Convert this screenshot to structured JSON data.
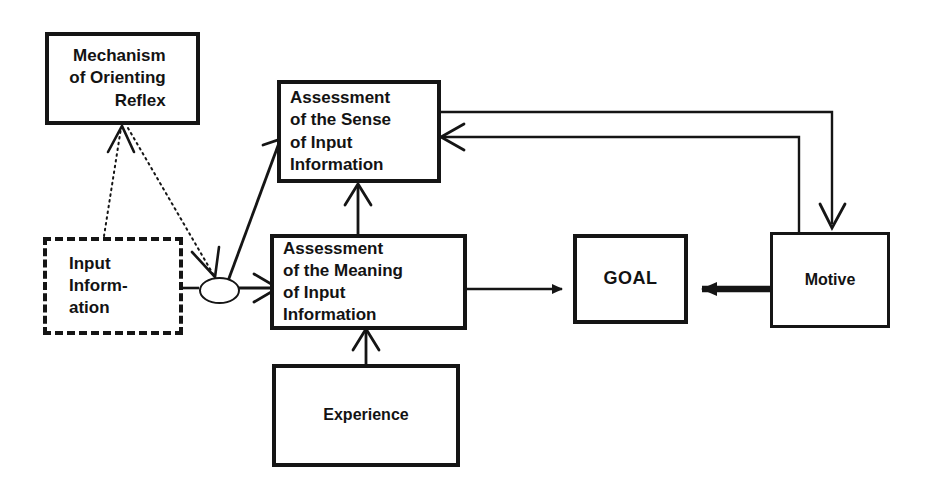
{
  "diagram": {
    "background": "#ffffff",
    "ink": "#151515",
    "nodes": [
      {
        "id": "mechanism",
        "label": "Mechanism\nof Orienting\nReflex",
        "style": "solid-thick"
      },
      {
        "id": "assessment-sense",
        "label": "Assessment\nof the Sense\n of Input\nInformation",
        "style": "solid-thick"
      },
      {
        "id": "assessment-meaning",
        "label": "Assessment\nof the Meaning\nof  Input\nInformation",
        "style": "solid-thick"
      },
      {
        "id": "input-information",
        "label": "Input\nInform-\nation",
        "style": "dashed"
      },
      {
        "id": "experience",
        "label": "Experience",
        "style": "solid-thick"
      },
      {
        "id": "goal",
        "label": "GOAL",
        "style": "solid-thick"
      },
      {
        "id": "motive",
        "label": "Motive",
        "style": "solid-med"
      },
      {
        "id": "junction",
        "label": "",
        "style": "ellipse"
      }
    ],
    "edges": [
      {
        "id": "input-to-junction",
        "from": "input-information",
        "to": "junction",
        "line": "solid",
        "arrow": "none"
      },
      {
        "id": "input-to-mechanism",
        "from": "input-information",
        "to": "mechanism",
        "line": "dotted",
        "arrow": "open-v"
      },
      {
        "id": "mechanism-to-junction",
        "from": "mechanism",
        "to": "junction",
        "line": "dotted",
        "arrow": "open-v"
      },
      {
        "id": "junction-to-assessment-sense",
        "from": "junction",
        "to": "assessment-sense",
        "line": "solid",
        "arrow": "open-v"
      },
      {
        "id": "junction-to-assessment-meaning",
        "from": "junction",
        "to": "assessment-meaning",
        "line": "solid",
        "arrow": "open-v"
      },
      {
        "id": "meaning-to-sense",
        "from": "assessment-meaning",
        "to": "assessment-sense",
        "line": "solid",
        "arrow": "open-v"
      },
      {
        "id": "experience-to-meaning",
        "from": "experience",
        "to": "assessment-meaning",
        "line": "solid",
        "arrow": "open-v"
      },
      {
        "id": "meaning-to-goal",
        "from": "assessment-meaning",
        "to": "goal",
        "line": "solid",
        "arrow": "filled-triangle"
      },
      {
        "id": "motive-to-goal",
        "from": "motive",
        "to": "goal",
        "line": "thick",
        "arrow": "filled-triangle"
      },
      {
        "id": "sense-to-motive",
        "from": "assessment-sense",
        "to": "motive",
        "line": "solid",
        "arrow": "filled-v-down"
      },
      {
        "id": "motive-to-sense",
        "from": "motive",
        "to": "assessment-sense",
        "line": "solid",
        "arrow": "open-v"
      }
    ]
  }
}
